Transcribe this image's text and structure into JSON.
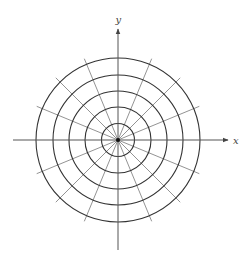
{
  "diagram": {
    "type": "polar-grid",
    "center": [
      118,
      140
    ],
    "circle_radii": [
      16.5,
      33,
      49,
      65,
      82
    ],
    "radial_line_count": 16,
    "radial_angle_step_deg": 22.5,
    "radial_length": 88,
    "colors": {
      "circles": "#333333",
      "radials": "#777777",
      "axes": "#555555",
      "labels": "#444444"
    },
    "axes": {
      "x_label": "x",
      "y_label": "y",
      "x_range_px": [
        13,
        228
      ],
      "y_range_px": [
        29,
        250
      ]
    }
  }
}
